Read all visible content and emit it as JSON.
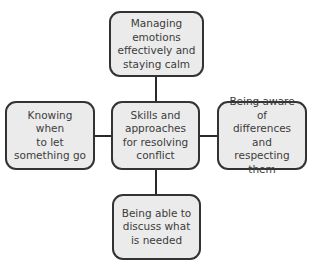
{
  "diagram": {
    "type": "hub-and-spoke",
    "center": {
      "label": "Skills and approaches for resolving conflict",
      "lines": [
        "Skills and",
        "approaches",
        "for resolving",
        "conflict"
      ]
    },
    "top": {
      "label": "Managing emotions effectively and staying calm",
      "lines": [
        "Managing",
        "emotions",
        "effectively and",
        "staying calm"
      ]
    },
    "left": {
      "label": "Knowing when to let something go",
      "lines": [
        "Knowing when",
        "to let",
        "something go"
      ]
    },
    "right": {
      "label": "Being aware of differences and respecting them",
      "lines": [
        "Being aware of",
        "differences and",
        "respecting them"
      ]
    },
    "bottom": {
      "label": "Being able to discuss what is needed",
      "lines": [
        "Being able to",
        "discuss what",
        "is needed"
      ]
    },
    "colors": {
      "box_fill": "#ebebeb",
      "box_border": "#333333",
      "text": "#3c3c3c",
      "connector": "#2a2a2a"
    }
  }
}
